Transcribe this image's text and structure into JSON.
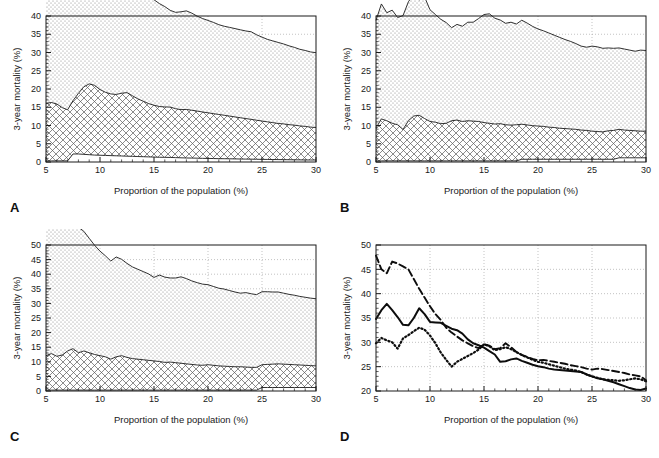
{
  "figure": {
    "panels": [
      {
        "id": "A",
        "letter": "A",
        "xlabel": "Proportion of the population (%)",
        "ylabel": "3-year mortality (%)",
        "xticks": [
          5,
          10,
          15,
          20,
          25,
          30
        ],
        "yticks": [
          0,
          5,
          10,
          15,
          20,
          25,
          30,
          35,
          40
        ],
        "xlim": [
          5,
          30
        ],
        "ylim": [
          0,
          40
        ]
      },
      {
        "id": "B",
        "letter": "B",
        "xlabel": "Proportion of the population (%)",
        "ylabel": "3-year mortality (%)",
        "xticks": [
          5,
          10,
          15,
          20,
          25,
          30
        ],
        "yticks": [
          0,
          5,
          10,
          15,
          20,
          25,
          30,
          35,
          40
        ],
        "xlim": [
          5,
          30
        ],
        "ylim": [
          0,
          40
        ]
      },
      {
        "id": "C",
        "letter": "C",
        "xlabel": "Proportion of the population (%)",
        "ylabel": "3-year mortality (%)",
        "xticks": [
          5,
          10,
          15,
          20,
          25,
          30
        ],
        "yticks": [
          0,
          5,
          10,
          15,
          20,
          25,
          30,
          35,
          40,
          45,
          50
        ],
        "xlim": [
          5,
          30
        ],
        "ylim": [
          0,
          50
        ]
      },
      {
        "id": "D",
        "letter": "D",
        "xlabel": "Proportion of the population (%)",
        "ylabel": "3-year mortality (%)",
        "xticks": [
          5,
          10,
          15,
          20,
          25,
          30
        ],
        "yticks": [
          20,
          25,
          30,
          35,
          40,
          45,
          50
        ],
        "xlim": [
          5,
          30
        ],
        "ylim": [
          20,
          50
        ]
      }
    ]
  },
  "chart_data": [
    {
      "panel": "A",
      "type": "area",
      "title": "",
      "xlabel": "Proportion of the population (%)",
      "ylabel": "3-year mortality (%)",
      "xlim": [
        5,
        30
      ],
      "ylim": [
        0,
        40
      ],
      "xticks": [
        5,
        10,
        15,
        20,
        25,
        30
      ],
      "yticks": [
        0,
        5,
        10,
        15,
        20,
        25,
        30,
        35,
        40
      ],
      "grid": true,
      "stacked": true,
      "x": [
        5,
        5.5,
        6,
        6.5,
        7,
        7.5,
        8,
        8.5,
        9,
        9.5,
        10,
        10.5,
        11,
        11.5,
        12,
        12.5,
        13,
        13.5,
        14,
        14.5,
        15,
        15.5,
        16,
        16.5,
        17,
        17.5,
        18,
        18.5,
        19,
        19.5,
        20,
        20.5,
        21,
        21.5,
        22,
        22.5,
        23,
        23.5,
        24,
        24.5,
        25,
        25.5,
        26,
        26.5,
        27,
        27.5,
        28,
        28.5,
        29,
        29.5,
        30
      ],
      "series": [
        {
          "name": "lower band (boundary 1)",
          "pattern": "solid-light",
          "values": [
            0.3,
            0.3,
            0.3,
            0.3,
            0.3,
            2.2,
            2.2,
            2.1,
            2.0,
            1.9,
            1.85,
            1.8,
            1.75,
            1.7,
            1.65,
            1.6,
            1.55,
            1.5,
            1.45,
            1.4,
            1.35,
            1.3,
            1.28,
            1.25,
            1.2,
            1.15,
            1.1,
            1.08,
            1.05,
            1.0,
            0.98,
            0.95,
            0.92,
            0.9,
            0.88,
            0.85,
            0.82,
            0.8,
            0.78,
            0.75,
            0.72,
            0.7,
            0.68,
            0.66,
            0.64,
            0.62,
            0.6,
            0.58,
            0.56,
            0.55,
            0.55
          ]
        },
        {
          "name": "middle band (boundary 2, crosshatch)",
          "pattern": "crosshatch",
          "values": [
            15.8,
            16.0,
            15.6,
            14.6,
            14.0,
            14.6,
            16.6,
            18.5,
            19.4,
            19.1,
            18.0,
            17.3,
            16.9,
            16.8,
            17.2,
            17.4,
            16.6,
            15.8,
            15.2,
            14.6,
            14.2,
            13.9,
            13.8,
            13.8,
            13.4,
            13.2,
            13.3,
            13.1,
            12.9,
            12.7,
            12.5,
            12.3,
            12.1,
            11.9,
            11.7,
            11.5,
            11.3,
            11.1,
            10.9,
            10.7,
            10.5,
            10.3,
            10.1,
            9.9,
            9.8,
            9.6,
            9.5,
            9.3,
            9.2,
            9.0,
            8.9
          ]
        },
        {
          "name": "upper band (boundary 3, stipple)",
          "pattern": "stipple",
          "values": [
            34.8,
            36.6,
            37.9,
            36.6,
            35.2,
            33.6,
            33.5,
            35.0,
            37.0,
            35.8,
            34.2,
            34.1,
            34.0,
            33.4,
            32.8,
            32.5,
            31.8,
            30.6,
            29.8,
            29.4,
            28.9,
            28.2,
            27.5,
            26.5,
            26.4,
            26.8,
            27.0,
            26.6,
            26.0,
            25.6,
            25.3,
            25.0,
            24.6,
            24.4,
            24.3,
            24.2,
            24.1,
            24.0,
            24.0,
            23.4,
            23.0,
            22.6,
            22.4,
            22.2,
            21.9,
            21.6,
            21.3,
            21.0,
            20.8,
            20.6,
            20.5
          ]
        }
      ]
    },
    {
      "panel": "B",
      "type": "area",
      "title": "",
      "xlabel": "Proportion of the population (%)",
      "ylabel": "3-year mortality (%)",
      "xlim": [
        5,
        30
      ],
      "ylim": [
        0,
        40
      ],
      "xticks": [
        5,
        10,
        15,
        20,
        25,
        30
      ],
      "yticks": [
        0,
        5,
        10,
        15,
        20,
        25,
        30,
        35,
        40
      ],
      "grid": true,
      "stacked": true,
      "x": [
        5,
        5.5,
        6,
        6.5,
        7,
        7.5,
        8,
        8.5,
        9,
        9.5,
        10,
        10.5,
        11,
        11.5,
        12,
        12.5,
        13,
        13.5,
        14,
        14.5,
        15,
        15.5,
        16,
        16.5,
        17,
        17.5,
        18,
        18.5,
        19,
        19.5,
        20,
        20.5,
        21,
        21.5,
        22,
        22.5,
        23,
        23.5,
        24,
        24.5,
        25,
        25.5,
        26,
        26.5,
        27,
        27.5,
        28,
        28.5,
        29,
        29.5,
        30
      ],
      "series": [
        {
          "name": "lower band (boundary 1)",
          "pattern": "solid-light",
          "values": [
            0.3,
            0.3,
            0.3,
            0.3,
            0.3,
            0.3,
            0.3,
            0.3,
            0.3,
            0.3,
            0.3,
            0.3,
            0.3,
            0.3,
            0.3,
            0.3,
            0.3,
            0.3,
            0.3,
            0.3,
            0.3,
            0.3,
            0.3,
            0.3,
            0.3,
            0.3,
            0.3,
            0.75,
            0.75,
            0.75,
            0.75,
            0.75,
            0.75,
            0.75,
            0.75,
            0.75,
            0.75,
            0.75,
            0.75,
            0.75,
            0.75,
            0.75,
            0.75,
            0.75,
            0.75,
            1.15,
            1.15,
            1.15,
            1.15,
            1.15,
            1.15
          ]
        },
        {
          "name": "middle band (boundary 2, crosshatch)",
          "pattern": "crosshatch",
          "values": [
            9.0,
            11.5,
            11.0,
            10.3,
            9.9,
            8.6,
            11.0,
            12.3,
            12.5,
            11.6,
            10.8,
            10.6,
            10.2,
            10.3,
            11.0,
            11.2,
            10.8,
            11.0,
            10.9,
            10.8,
            10.5,
            10.3,
            10.1,
            10.2,
            9.9,
            9.8,
            9.9,
            9.6,
            9.4,
            9.2,
            9.1,
            9.0,
            8.8,
            8.7,
            8.5,
            8.4,
            8.3,
            8.2,
            8.0,
            7.9,
            7.7,
            7.6,
            7.5,
            7.8,
            7.9,
            7.8,
            7.6,
            7.5,
            7.4,
            7.3,
            7.3
          ]
        },
        {
          "name": "upper band (boundary 3, stipple)",
          "pattern": "stipple",
          "values": [
            29.5,
            31.5,
            29.6,
            31.0,
            29.4,
            31.2,
            32.6,
            33.4,
            31.6,
            33.3,
            30.6,
            29.5,
            28.6,
            27.6,
            25.5,
            26.2,
            26.1,
            27.0,
            27.1,
            28.2,
            29.6,
            30.0,
            29.0,
            28.4,
            27.8,
            28.2,
            27.6,
            28.5,
            27.9,
            27.2,
            26.6,
            26.2,
            25.8,
            25.3,
            24.9,
            24.4,
            24.0,
            23.5,
            23.0,
            22.8,
            23.3,
            23.2,
            22.9,
            22.7,
            22.5,
            22.3,
            22.2,
            22.0,
            21.8,
            22.2,
            22.1
          ]
        }
      ]
    },
    {
      "panel": "C",
      "type": "area",
      "title": "",
      "xlabel": "Proportion of the population (%)",
      "ylabel": "3-year mortality (%)",
      "xlim": [
        5,
        30
      ],
      "ylim": [
        0,
        50
      ],
      "xticks": [
        5,
        10,
        15,
        20,
        25,
        30
      ],
      "yticks": [
        0,
        5,
        10,
        15,
        20,
        25,
        30,
        35,
        40,
        45,
        50
      ],
      "grid": true,
      "stacked": true,
      "x": [
        5,
        5.5,
        6,
        6.5,
        7,
        7.5,
        8,
        8.5,
        9,
        9.5,
        10,
        10.5,
        11,
        11.5,
        12,
        12.5,
        13,
        13.5,
        14,
        14.5,
        15,
        15.5,
        16,
        16.5,
        17,
        17.5,
        18,
        18.5,
        19,
        19.5,
        20,
        20.5,
        21,
        21.5,
        22,
        22.5,
        23,
        23.5,
        24,
        24.5,
        25,
        25.5,
        26,
        26.5,
        27,
        27.5,
        28,
        28.5,
        29,
        29.5,
        30
      ],
      "series": [
        {
          "name": "lower band (boundary 1)",
          "pattern": "solid-light",
          "values": [
            0.3,
            0.3,
            0.3,
            0.3,
            0.3,
            0.3,
            0.3,
            0.3,
            0.3,
            0.3,
            0.3,
            0.3,
            0.3,
            0.3,
            0.3,
            0.3,
            0.3,
            0.3,
            0.3,
            0.3,
            0.3,
            0.3,
            0.3,
            0.3,
            0.3,
            0.3,
            0.3,
            0.3,
            0.3,
            0.3,
            0.3,
            0.3,
            0.3,
            0.3,
            0.3,
            0.3,
            0.3,
            0.3,
            0.3,
            0.3,
            1.2,
            1.2,
            1.2,
            1.2,
            1.2,
            1.2,
            1.2,
            1.2,
            1.2,
            1.2,
            1.2
          ]
        },
        {
          "name": "middle band (boundary 2, crosshatch)",
          "pattern": "crosshatch",
          "values": [
            11.8,
            12.5,
            11.6,
            12.0,
            13.4,
            14.2,
            12.8,
            13.4,
            12.8,
            12.2,
            11.8,
            11.4,
            10.6,
            11.4,
            11.8,
            11.2,
            10.8,
            10.6,
            10.4,
            10.2,
            10.0,
            9.8,
            9.5,
            9.6,
            9.4,
            9.2,
            9.0,
            8.8,
            8.6,
            8.5,
            8.7,
            8.5,
            8.3,
            8.2,
            8.1,
            8.0,
            8.0,
            7.9,
            7.8,
            7.8,
            7.8,
            7.9,
            8.0,
            8.1,
            8.0,
            7.9,
            7.8,
            7.7,
            7.6,
            7.5,
            7.4
          ]
        },
        {
          "name": "upper band (boundary 3, stipple)",
          "pattern": "stipple",
          "values": [
            48.5,
            45.0,
            44.2,
            46.6,
            46.2,
            45.6,
            43.0,
            41.0,
            39.2,
            37.4,
            35.8,
            34.6,
            33.6,
            34.2,
            33.0,
            32.2,
            31.4,
            30.8,
            30.2,
            29.6,
            28.6,
            29.6,
            29.2,
            28.8,
            29.0,
            29.6,
            29.2,
            28.6,
            28.2,
            27.8,
            27.4,
            27.0,
            26.6,
            26.4,
            26.0,
            25.6,
            25.2,
            25.5,
            25.2,
            24.9,
            25.0,
            24.9,
            24.7,
            24.6,
            24.3,
            24.0,
            23.8,
            23.5,
            23.3,
            23.1,
            23.0
          ]
        }
      ]
    },
    {
      "panel": "D",
      "type": "line",
      "title": "",
      "xlabel": "Proportion of the population (%)",
      "ylabel": "3-year mortality (%)",
      "xlim": [
        5,
        30
      ],
      "ylim": [
        20,
        50
      ],
      "xticks": [
        5,
        10,
        15,
        20,
        25,
        30
      ],
      "yticks": [
        20,
        25,
        30,
        35,
        40,
        45,
        50
      ],
      "grid": true,
      "x": [
        5,
        5.5,
        6,
        6.5,
        7,
        7.5,
        8,
        8.5,
        9,
        9.5,
        10,
        10.5,
        11,
        11.5,
        12,
        12.5,
        13,
        13.5,
        14,
        14.5,
        15,
        15.5,
        16,
        16.5,
        17,
        17.5,
        18,
        18.5,
        19,
        19.5,
        20,
        20.5,
        21,
        21.5,
        22,
        22.5,
        23,
        23.5,
        24,
        24.5,
        25,
        25.5,
        26,
        26.5,
        27,
        27.5,
        28,
        28.5,
        29,
        29.5,
        30
      ],
      "series": [
        {
          "name": "solid curve",
          "style": "solid",
          "values": [
            34.8,
            36.6,
            37.9,
            36.6,
            35.2,
            33.6,
            33.5,
            35.0,
            37.0,
            35.8,
            34.2,
            34.1,
            34.0,
            33.4,
            32.8,
            32.5,
            31.8,
            30.6,
            29.8,
            29.4,
            28.9,
            28.2,
            27.5,
            26.0,
            26.1,
            26.5,
            26.7,
            26.2,
            25.8,
            25.4,
            25.1,
            24.9,
            24.6,
            24.4,
            24.3,
            24.2,
            24.1,
            24.0,
            23.9,
            23.4,
            23.0,
            22.6,
            22.4,
            22.1,
            21.8,
            21.4,
            21.0,
            20.6,
            20.3,
            20.2,
            20.5
          ]
        },
        {
          "name": "dashed curve",
          "style": "dashed",
          "values": [
            47.8,
            45.0,
            44.2,
            46.6,
            46.2,
            45.6,
            45.0,
            43.0,
            41.0,
            39.2,
            37.4,
            35.8,
            34.6,
            33.0,
            32.0,
            31.2,
            30.4,
            29.8,
            29.2,
            28.8,
            29.6,
            29.3,
            28.6,
            28.8,
            29.8,
            29.0,
            28.0,
            27.4,
            27.0,
            26.6,
            26.3,
            26.4,
            26.2,
            26.0,
            25.8,
            25.6,
            25.3,
            25.1,
            24.9,
            24.6,
            24.4,
            24.6,
            24.5,
            24.3,
            24.1,
            23.9,
            23.7,
            23.4,
            23.2,
            23.0,
            22.2
          ]
        },
        {
          "name": "dotted curve",
          "style": "dotted",
          "values": [
            29.8,
            30.9,
            30.4,
            30.0,
            28.7,
            30.8,
            31.5,
            32.3,
            33.0,
            32.6,
            31.4,
            29.8,
            27.9,
            26.4,
            25.0,
            26.0,
            26.6,
            27.2,
            27.8,
            28.5,
            29.6,
            29.2,
            28.4,
            28.6,
            29.0,
            28.6,
            28.0,
            27.4,
            26.9,
            26.4,
            26.0,
            25.8,
            25.5,
            25.2,
            24.9,
            24.6,
            24.4,
            24.2,
            23.9,
            23.4,
            23.0,
            22.7,
            22.4,
            22.3,
            22.2,
            22.1,
            22.2,
            22.4,
            22.6,
            22.4,
            22.0
          ]
        }
      ]
    }
  ]
}
